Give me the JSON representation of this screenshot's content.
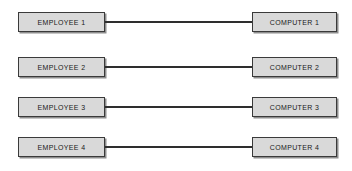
{
  "diagram": {
    "type": "one-to-one relationship mapping",
    "background_color": "#ffffff",
    "node_fill_color": "#d9d9d9",
    "node_border_color": "#3a3a3a",
    "connector_color": "#2e2e2e",
    "rows": [
      {
        "left_label": "EMPLOYEE 1",
        "right_label": "COMPUTER 1",
        "connector": "line"
      },
      {
        "left_label": "EMPLOYEE 2",
        "right_label": "COMPUTER 2",
        "connector": "line"
      },
      {
        "left_label": "EMPLOYEE 3",
        "right_label": "COMPUTER 3",
        "connector": "line"
      },
      {
        "left_label": "EMPLOYEE 4",
        "right_label": "COMPUTER 4",
        "connector": "line"
      }
    ]
  }
}
